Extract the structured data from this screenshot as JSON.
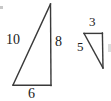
{
  "figure": {
    "kind": "geometry-diagram",
    "background_color": "#ffffff",
    "stroke_color": "#3a3a3a",
    "text_color": "#1a1a1a",
    "shapes": [
      {
        "name": "large-right-triangle",
        "vertices": [
          [
            50,
            4
          ],
          [
            51,
            85
          ],
          [
            13,
            85
          ]
        ],
        "labels": {
          "hypotenuse": "10",
          "vertical_leg": "8",
          "horizontal_leg": "6"
        }
      },
      {
        "name": "small-right-triangle",
        "vertices": [
          [
            84,
            33
          ],
          [
            102,
            33
          ],
          [
            103,
            68
          ]
        ],
        "labels": {
          "horizontal_leg": "3",
          "hypotenuse": "5",
          "vertical_leg": ""
        }
      }
    ],
    "labels": {
      "big_hypotenuse": "10",
      "big_vertical": "8",
      "big_base": "6",
      "small_top": "3",
      "small_hypotenuse": "5"
    }
  }
}
